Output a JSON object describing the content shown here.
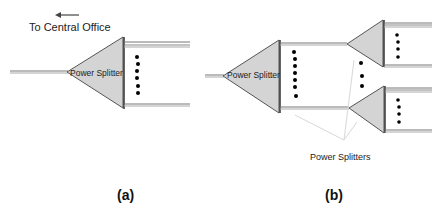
{
  "diagram": {
    "panel_a": {
      "direction_label": "To Central Office",
      "splitter_label": "Power Splitter",
      "caption": "(a)"
    },
    "panel_b": {
      "splitter_label": "Power Splitter",
      "annotation_label": "Power Splitters",
      "caption": "(b)"
    },
    "colors": {
      "triangle_fill": "#d4d4d4",
      "triangle_stroke": "#555555",
      "line": "#666666",
      "arrow": "#444444",
      "leader_line": "#e0e0e0",
      "dot": "#000000"
    }
  }
}
